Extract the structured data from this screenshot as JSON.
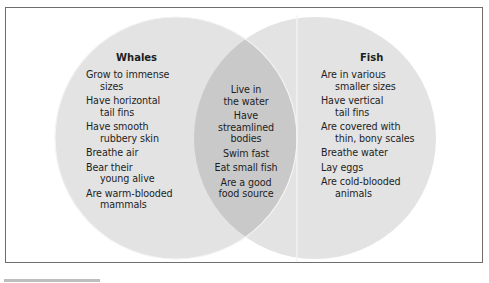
{
  "diagram": {
    "type": "venn",
    "colors": {
      "circle_fill": "#e3e3e3",
      "overlap_fill": "#c9c9c9",
      "frame_border": "#6e6e6e",
      "text": "#1e1e1e"
    },
    "left": {
      "title": "Whales",
      "items": [
        {
          "line1": "Grow to immense",
          "line2": "sizes"
        },
        {
          "line1": "Have horizontal",
          "line2": "tail fins"
        },
        {
          "line1": "Have smooth",
          "line2": "rubbery skin"
        },
        {
          "line1": "Breathe air",
          "line2": null
        },
        {
          "line1": "Bear their",
          "line2": "young alive"
        },
        {
          "line1": "Are warm-blooded",
          "line2": "mammals"
        }
      ]
    },
    "overlap": {
      "items": [
        {
          "line1": "Live in",
          "line2": "the water"
        },
        {
          "line1": "Have",
          "line2": "streamlined",
          "line3": "bodies"
        },
        {
          "line1": "Swim fast",
          "line2": null
        },
        {
          "line1": "Eat small fish",
          "line2": null
        },
        {
          "line1": "Are a good",
          "line2": "food source"
        }
      ]
    },
    "right": {
      "title": "Fish",
      "items": [
        {
          "line1": "Are in various",
          "line2": "smaller sizes"
        },
        {
          "line1": "Have vertical",
          "line2": "tail fins"
        },
        {
          "line1": "Are covered with",
          "line2": "thin, bony scales"
        },
        {
          "line1": "Breathe water",
          "line2": null
        },
        {
          "line1": "Lay eggs",
          "line2": null
        },
        {
          "line1": "Are cold-blooded",
          "line2": "animals"
        }
      ]
    }
  }
}
